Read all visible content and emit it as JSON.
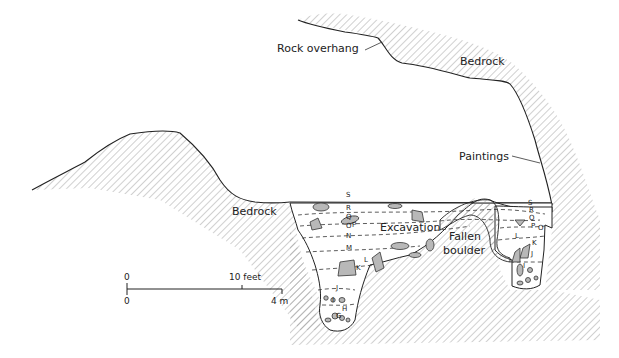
{
  "diagram": {
    "labels": {
      "rock_overhang": "Rock overhang",
      "bedrock_upper": "Bedrock",
      "paintings": "Paintings",
      "bedrock_lower": "Bedrock",
      "excavation": "Excavation",
      "fallen_boulder_line1": "Fallen",
      "fallen_boulder_line2": "boulder"
    },
    "layers_left": [
      "S",
      "R",
      "Q",
      "P",
      "O",
      "N",
      "M",
      "L",
      "K",
      "J",
      "I",
      "H",
      "G"
    ],
    "layers_right": [
      "S",
      "R",
      "Q",
      "P",
      "O",
      "L",
      "K",
      "J",
      "I"
    ],
    "scale_bar": {
      "top_start": "0",
      "top_end": "10 feet",
      "bottom_start": "0",
      "bottom_end": "4 m"
    },
    "colors": {
      "ink": "#222222",
      "hatch": "#8a8a8a",
      "stone_fill": "#b8b8b8",
      "background": "#ffffff"
    }
  }
}
